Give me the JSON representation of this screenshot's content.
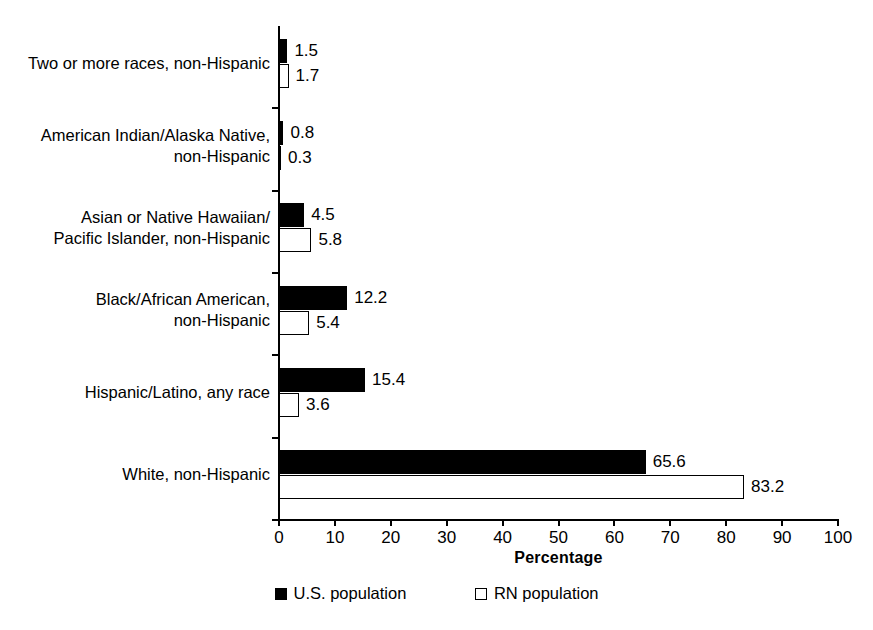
{
  "chart_data": {
    "type": "bar",
    "orientation": "horizontal",
    "title": "",
    "xlabel": "Percentage",
    "ylabel": "",
    "xlim": [
      0,
      100
    ],
    "xticks": [
      0,
      10,
      20,
      30,
      40,
      50,
      60,
      70,
      80,
      90,
      100
    ],
    "grid": false,
    "legend_position": "bottom",
    "categories": [
      "Two or more races, non-Hispanic",
      "American Indian/Alaska Native,\nnon-Hispanic",
      "Asian or Native Hawaiian/\nPacific Islander, non-Hispanic",
      "Black/African American,\nnon-Hispanic",
      "Hispanic/Latino, any race",
      "White, non-Hispanic"
    ],
    "series": [
      {
        "name": "U.S. population",
        "color": "#000000",
        "style": "filled",
        "values": [
          1.5,
          0.8,
          4.5,
          12.2,
          15.4,
          65.6
        ]
      },
      {
        "name": "RN population",
        "color": "#ffffff",
        "style": "outline",
        "values": [
          1.7,
          0.3,
          5.8,
          5.4,
          3.6,
          83.2
        ]
      }
    ],
    "data_labels": {
      "U.S. population": [
        "1.5",
        "0.8",
        "4.5",
        "12.2",
        "15.4",
        "65.6"
      ],
      "RN population": [
        "1.7",
        "0.3",
        "5.8",
        "5.4",
        "3.6",
        "83.2"
      ]
    }
  },
  "legend": {
    "entries": [
      {
        "label": "U.S. population",
        "marker": "filled-square-icon"
      },
      {
        "label": "RN population",
        "marker": "outline-square-icon"
      }
    ]
  },
  "axis": {
    "x_title": "Percentage",
    "x_tick_labels": [
      "0",
      "10",
      "20",
      "30",
      "40",
      "50",
      "60",
      "70",
      "80",
      "90",
      "100"
    ]
  }
}
